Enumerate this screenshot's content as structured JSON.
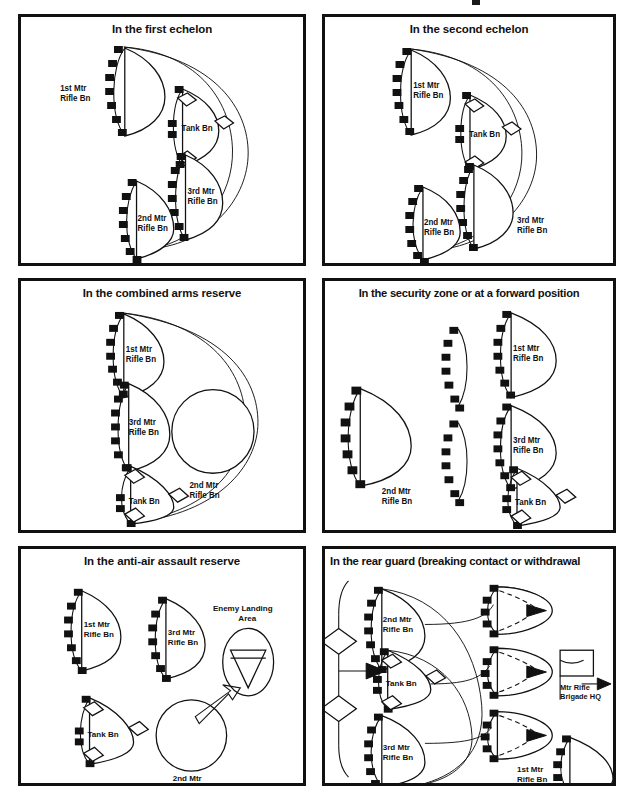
{
  "document": {
    "type": "military-tactical-diagram",
    "description": "Six-panel diagram of motorized rifle battalion employment options",
    "background_color": "#ffffff",
    "ink_color": "#111111",
    "partial_cropped_glyph_top": true
  },
  "panels": [
    {
      "id": "first-echelon",
      "title": "In the first echelon",
      "units": [
        {
          "name": "1st Mtr\nRifle Bn",
          "line1": "1st Mtr",
          "line2": "Rifle Bn",
          "type": "motorized-rifle",
          "fill": "hatched"
        },
        {
          "name": "Tank Bn",
          "line1": "Tank Bn",
          "line2": "",
          "type": "tank",
          "fill": "open"
        },
        {
          "name": "3rd Mtr\nRifle Bn",
          "line1": "3rd Mtr",
          "line2": "Rifle Bn",
          "type": "motorized-rifle",
          "fill": "open"
        },
        {
          "name": "2nd Mtr\nRifle Bn",
          "line1": "2nd Mtr",
          "line2": "Rifle Bn",
          "type": "motorized-rifle",
          "fill": "open"
        }
      ]
    },
    {
      "id": "second-echelon",
      "title": "In the second echelon",
      "units": [
        {
          "line1": "1st Mtr",
          "line2": "Rifle Bn",
          "type": "motorized-rifle",
          "fill": "open"
        },
        {
          "line1": "Tank Bn",
          "line2": "",
          "type": "tank",
          "fill": "open"
        },
        {
          "line1": "3rd Mtr",
          "line2": "Rifle Bn",
          "type": "motorized-rifle",
          "fill": "hatched"
        },
        {
          "line1": "2nd Mtr",
          "line2": "Rifle Bn",
          "type": "motorized-rifle",
          "fill": "open"
        }
      ]
    },
    {
      "id": "combined-arms-reserve",
      "title": "In the combined arms reserve",
      "units": [
        {
          "line1": "1st Mtr",
          "line2": "Rifle Bn",
          "type": "motorized-rifle",
          "fill": "open"
        },
        {
          "line1": "3rd Mtr",
          "line2": "Rifle Bn",
          "type": "motorized-rifle",
          "fill": "open"
        },
        {
          "line1": "Tank Bn",
          "line2": "",
          "type": "tank",
          "fill": "open"
        },
        {
          "line1": "2nd Mtr",
          "line2": "Rifle Bn",
          "type": "reserve-circle",
          "fill": "hatched"
        }
      ]
    },
    {
      "id": "security-zone",
      "title": "In the security zone or at a forward position",
      "units": [
        {
          "line1": "2nd Mtr",
          "line2": "Rifle Bn",
          "type": "motorized-rifle",
          "fill": "hatched"
        },
        {
          "line1": "1st Mtr",
          "line2": "Rifle Bn",
          "type": "motorized-rifle",
          "fill": "open"
        },
        {
          "line1": "3rd Mtr",
          "line2": "Rifle Bn",
          "type": "motorized-rifle",
          "fill": "open"
        },
        {
          "line1": "Tank Bn",
          "line2": "",
          "type": "tank",
          "fill": "open"
        }
      ],
      "extra_symbols": [
        "crenellated-arc",
        "crenellated-arc"
      ]
    },
    {
      "id": "anti-air-assault-reserve",
      "title": "In the anti-air assault reserve",
      "units": [
        {
          "line1": "1st Mtr",
          "line2": "Rifle Bn",
          "type": "motorized-rifle",
          "fill": "open"
        },
        {
          "line1": "3rd Mtr",
          "line2": "Rifle Bn",
          "type": "motorized-rifle",
          "fill": "open"
        },
        {
          "line1": "Tank Bn",
          "line2": "",
          "type": "tank",
          "fill": "open"
        },
        {
          "line1": "2nd Mtr",
          "line2": "Rifle Bn",
          "type": "reserve-circle",
          "fill": "hatched"
        }
      ],
      "annotations": [
        {
          "line1": "Enemy Landing",
          "line2": "Area",
          "type": "air-assault-objective"
        }
      ]
    },
    {
      "id": "rear-guard",
      "title": "In the rear guard (breaking contact or withdrawal",
      "units": [
        {
          "line1": "2nd Mtr",
          "line2": "Rifle Bn",
          "type": "motorized-rifle",
          "fill": "open"
        },
        {
          "line1": "Tank Bn",
          "line2": "",
          "type": "tank",
          "fill": "open"
        },
        {
          "line1": "3rd Mtr",
          "line2": "Rifle Bn",
          "type": "motorized-rifle",
          "fill": "open"
        },
        {
          "line1": "1st Mtr",
          "line2": "Rifle Bn",
          "type": "motorized-rifle",
          "fill": "hatched"
        }
      ],
      "annotations": [
        {
          "line1": "Mtr Rifle",
          "line2": "Brigade HQ",
          "type": "headquarters"
        }
      ],
      "extra_symbols": [
        "enemy-flot-line",
        "advance-arrow",
        "withdrawal-dashed-routes"
      ]
    }
  ]
}
